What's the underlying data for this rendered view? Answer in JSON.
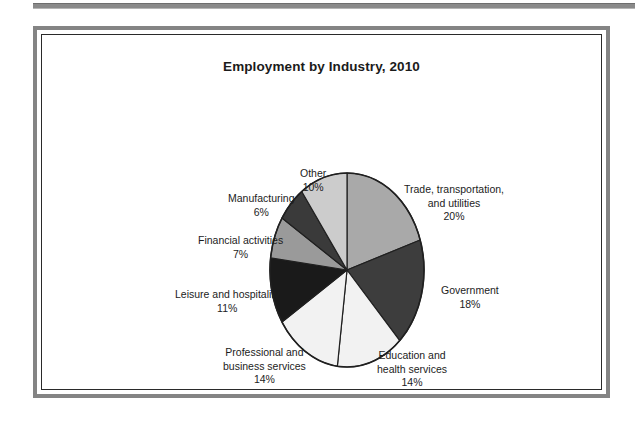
{
  "figure": {
    "title": "Employment by Industry, 2010"
  },
  "chart_data": {
    "type": "pie",
    "title": "Employment by Industry, 2010",
    "xlabel": "",
    "ylabel": "",
    "legend_position": "none",
    "grid": false,
    "units": "percent",
    "start_angle_deg": 0,
    "direction": "clockwise",
    "categories": [
      "Trade, transportation, and utilities",
      "Government",
      "Education and health services",
      "Professional and business services",
      "Leisure and hospitality",
      "Financial activities",
      "Manufacturing",
      "Other"
    ],
    "values": [
      20,
      18,
      14,
      14,
      11,
      7,
      6,
      10
    ],
    "value_labels": [
      "20%",
      "18%",
      "14%",
      "14%",
      "11%",
      "7%",
      "6%",
      "10%"
    ],
    "colors": [
      "#a9a9a9",
      "#3d3d3d",
      "#f2f2f2",
      "#f2f2f2",
      "#1a1a1a",
      "#9a9a9a",
      "#3a3a3a",
      "#cccccc"
    ],
    "slices": [
      {
        "name": "Trade, transportation, and utilities",
        "line1": "Trade, transportation,",
        "line2": "and utilities",
        "value": 20,
        "value_label": "20%",
        "color": "#a9a9a9"
      },
      {
        "name": "Government",
        "line1": "Government",
        "line2": "",
        "value": 18,
        "value_label": "18%",
        "color": "#3d3d3d"
      },
      {
        "name": "Education and health services",
        "line1": "Education and",
        "line2": "health services",
        "value": 14,
        "value_label": "14%",
        "color": "#f2f2f2"
      },
      {
        "name": "Professional and business services",
        "line1": "Professional and",
        "line2": "business services",
        "value": 14,
        "value_label": "14%",
        "color": "#f2f2f2"
      },
      {
        "name": "Leisure and hospitality",
        "line1": "Leisure and hospitality",
        "line2": "",
        "value": 11,
        "value_label": "11%",
        "color": "#1a1a1a"
      },
      {
        "name": "Financial activities",
        "line1": "Financial activities",
        "line2": "",
        "value": 7,
        "value_label": "7%",
        "color": "#9a9a9a"
      },
      {
        "name": "Manufacturing",
        "line1": "Manufacturing",
        "line2": "",
        "value": 6,
        "value_label": "6%",
        "color": "#3a3a3a"
      },
      {
        "name": "Other",
        "line1": "Other",
        "line2": "",
        "value": 10,
        "value_label": "10%",
        "color": "#cccccc"
      }
    ]
  },
  "style": {
    "frame_color": "#848484",
    "inner_rule_color": "#2a2a2a",
    "outline_color": "#202020",
    "text_color": "#1c1c1c",
    "background": "#ffffff"
  }
}
